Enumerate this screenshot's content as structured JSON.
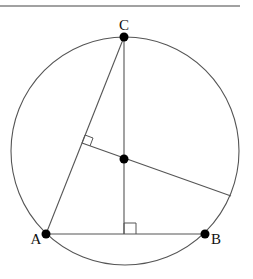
{
  "figure": {
    "type": "geometry",
    "colors": {
      "stroke": "#555555",
      "point": "#000000",
      "label": "#111111",
      "rule": "#444444"
    }
  },
  "header_rule": {
    "x1": 0,
    "y1": 6,
    "x2": 240,
    "y2": 6
  },
  "circle": {
    "cx": 125,
    "cy": 151,
    "r": 114
  },
  "points": [
    {
      "id": "C",
      "label": "C",
      "x": 124,
      "y": 37,
      "lx": 124,
      "ly": 30
    },
    {
      "id": "A",
      "label": "A",
      "x": 46,
      "y": 234,
      "lx": 36,
      "ly": 244
    },
    {
      "id": "B",
      "label": "B",
      "x": 205,
      "y": 234,
      "lx": 216,
      "ly": 244
    },
    {
      "id": "H",
      "label": "",
      "x": 124,
      "y": 159
    }
  ],
  "segments": [
    {
      "name": "side-AC",
      "x1": 46,
      "y1": 234,
      "x2": 124,
      "y2": 37
    },
    {
      "name": "side-AB",
      "x1": 46,
      "y1": 234,
      "x2": 205,
      "y2": 234
    },
    {
      "name": "altitude-from-C",
      "x1": 124,
      "y1": 37,
      "x2": 124,
      "y2": 234
    },
    {
      "name": "perpendicular-to-AC",
      "x1": 82,
      "y1": 143,
      "x2": 231,
      "y2": 196
    }
  ],
  "right_angles": [
    {
      "name": "right-angle-at-AB",
      "points": "124,234 124,223 136,223 136,234"
    },
    {
      "name": "right-angle-at-AC",
      "points": "82,143 85,135 93,138 90,146"
    }
  ]
}
